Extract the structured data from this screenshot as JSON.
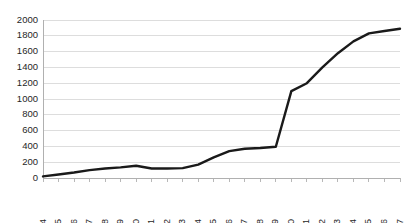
{
  "chart_data": {
    "type": "line",
    "title": "",
    "subtitle": "",
    "xlabel": "",
    "ylabel": "",
    "categories": [
      "2004",
      "2005",
      "2006",
      "2007",
      "2008",
      "2009",
      "2010",
      "2011",
      "2012",
      "2013",
      "2014",
      "2015",
      "2016",
      "2017",
      "2018",
      "2019",
      "2020",
      "2021",
      "2022",
      "2023",
      "2024",
      "2025",
      "2026",
      "2027"
    ],
    "series": [
      {
        "name": "series-1",
        "color": "#1a1a1a",
        "values": [
          20,
          45,
          70,
          100,
          120,
          135,
          155,
          120,
          120,
          125,
          170,
          260,
          340,
          370,
          380,
          395,
          1100,
          1200,
          1400,
          1580,
          1730,
          1830,
          1860,
          1890
        ]
      }
    ],
    "ylim": [
      0,
      2000
    ],
    "ytick_values": [
      0,
      200,
      400,
      600,
      800,
      1000,
      1200,
      1400,
      1600,
      1800,
      2000
    ],
    "ytick_labels": [
      "0",
      "200",
      "400",
      "600",
      "800",
      "1000",
      "1200",
      "1400",
      "1600",
      "1800",
      "2000"
    ],
    "grid": true,
    "grid_axis": "y",
    "grid_color": "#d9d9d9",
    "legend": false,
    "legend_position": "none",
    "xtick_rotation": 90,
    "annotations": []
  },
  "plot": {
    "left": 43,
    "right": 400,
    "top": 20,
    "bottom": 178
  }
}
